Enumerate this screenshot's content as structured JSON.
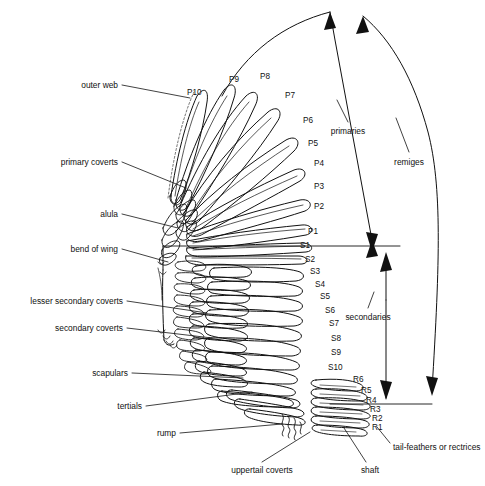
{
  "figure": {
    "background_color": "#ffffff",
    "ink_color": "#111111"
  },
  "annotations": {
    "left_labels": [
      {
        "text": "outer web",
        "x": 118,
        "y": 85,
        "lx": 190,
        "ly": 98
      },
      {
        "text": "primary coverts",
        "x": 118,
        "y": 162,
        "lx": 186,
        "ly": 188
      },
      {
        "text": "alula",
        "x": 118,
        "y": 214,
        "lx": 178,
        "ly": 228
      },
      {
        "text": "bend of wing",
        "x": 118,
        "y": 249,
        "lx": 168,
        "ly": 262
      },
      {
        "text": "lesser secondary coverts",
        "x": 123,
        "y": 301,
        "lx": 207,
        "ly": 313
      },
      {
        "text": "secondary coverts",
        "x": 123,
        "y": 328,
        "lx": 212,
        "ly": 338
      },
      {
        "text": "scapulars",
        "x": 128,
        "y": 373,
        "lx": 243,
        "ly": 378
      },
      {
        "text": "tertials",
        "x": 142,
        "y": 406,
        "lx": 252,
        "ly": 392
      },
      {
        "text": "rump",
        "x": 176,
        "y": 433,
        "lx": 282,
        "ly": 424
      }
    ],
    "bottom_labels": [
      {
        "text": "uppertail coverts",
        "x": 262,
        "y": 470,
        "lx": 310,
        "ly": 432
      },
      {
        "text": "shaft",
        "x": 370,
        "y": 470,
        "lx": 344,
        "ly": 428
      }
    ],
    "right_labels": [
      {
        "text": "tail-feathers or rectrices",
        "x": 393,
        "y": 447,
        "lx": 377,
        "ly": 427
      }
    ],
    "bracket_labels": [
      {
        "text": "primaries",
        "x": 348,
        "y": 131
      },
      {
        "text": "secondaries",
        "x": 368,
        "y": 317
      },
      {
        "text": "remiges",
        "x": 409,
        "y": 162
      }
    ]
  },
  "feather_labels": {
    "primaries": [
      {
        "id": "P10",
        "x": 187,
        "y": 92
      },
      {
        "id": "P9",
        "x": 229,
        "y": 79
      },
      {
        "id": "P8",
        "x": 260,
        "y": 76
      },
      {
        "id": "P7",
        "x": 285,
        "y": 95
      },
      {
        "id": "P6",
        "x": 303,
        "y": 120
      },
      {
        "id": "P5",
        "x": 308,
        "y": 143
      },
      {
        "id": "P4",
        "x": 314,
        "y": 163
      },
      {
        "id": "P3",
        "x": 314,
        "y": 186
      },
      {
        "id": "P2",
        "x": 314,
        "y": 206
      },
      {
        "id": "P1",
        "x": 308,
        "y": 231
      }
    ],
    "secondaries": [
      {
        "id": "S1",
        "x": 300,
        "y": 245
      },
      {
        "id": "S2",
        "x": 305,
        "y": 259
      },
      {
        "id": "S3",
        "x": 310,
        "y": 271
      },
      {
        "id": "S4",
        "x": 315,
        "y": 284
      },
      {
        "id": "S5",
        "x": 320,
        "y": 296
      },
      {
        "id": "S6",
        "x": 325,
        "y": 310
      },
      {
        "id": "S7",
        "x": 329,
        "y": 323
      },
      {
        "id": "S8",
        "x": 331,
        "y": 338
      },
      {
        "id": "S9",
        "x": 331,
        "y": 352
      },
      {
        "id": "S10",
        "x": 328,
        "y": 367
      }
    ],
    "rectrices": [
      {
        "id": "R6",
        "x": 353,
        "y": 379
      },
      {
        "id": "R5",
        "x": 361,
        "y": 390
      },
      {
        "id": "R4",
        "x": 366,
        "y": 400
      },
      {
        "id": "R3",
        "x": 370,
        "y": 409
      },
      {
        "id": "R2",
        "x": 372,
        "y": 418
      },
      {
        "id": "R1",
        "x": 372,
        "y": 427
      }
    ]
  }
}
